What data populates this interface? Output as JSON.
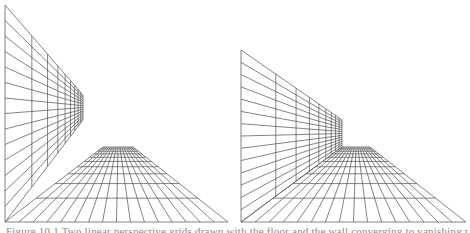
{
  "figure": {
    "caption": "Figure 10.1 Two linear perspective grids drawn with the floor and the wall converging to vanishing points",
    "stroke_color": "#5a5a5a",
    "background": "#ffffff",
    "panels": [
      {
        "id": "left",
        "description": "Wall and floor converge to separate vanishing regions",
        "wall": {
          "near_x": 5,
          "near_top": 5,
          "near_bottom": 222,
          "far_x": 83,
          "far_top": 95,
          "far_bottom": 120,
          "rows": 14,
          "cols": 9
        },
        "floor": {
          "near_y": 222,
          "near_left": 5,
          "near_right": 228,
          "far_y": 147,
          "far_left": 103,
          "far_right": 133,
          "rows": 10,
          "cols": 16
        }
      },
      {
        "id": "right",
        "description": "Wall and floor meet at a common corner",
        "wall": {
          "near_x": 241,
          "near_top": 50,
          "near_bottom": 222,
          "far_x": 342,
          "far_top": 120,
          "far_bottom": 147,
          "rows": 14,
          "cols": 9
        },
        "floor": {
          "near_y": 222,
          "near_left": 241,
          "near_right": 466,
          "far_y": 147,
          "far_left": 342,
          "far_right": 370,
          "rows": 10,
          "cols": 16
        }
      }
    ]
  }
}
